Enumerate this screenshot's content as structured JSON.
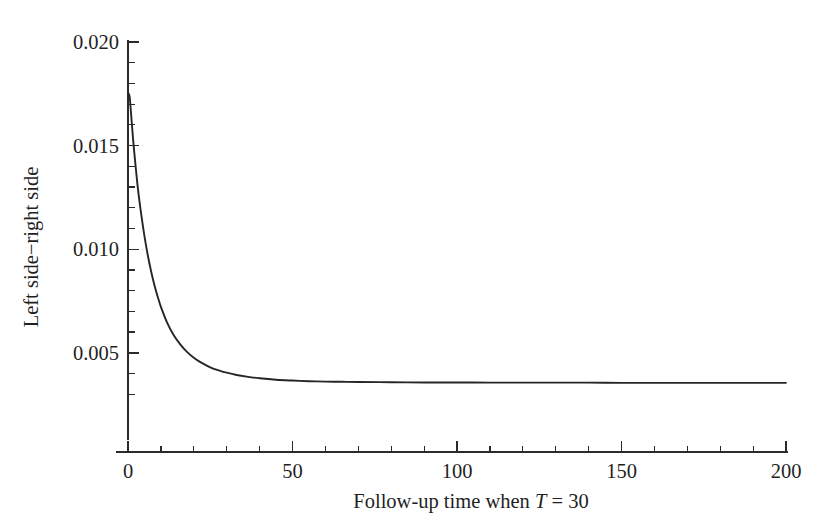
{
  "chart_data": {
    "type": "line",
    "title": "",
    "xlabel": "Follow-up time when T = 30",
    "xlabel_parts": {
      "prefix": "Follow-up time when ",
      "italic_symbol": "T",
      "suffix": " = 30"
    },
    "ylabel": "Left side−right side",
    "xlim": [
      0,
      200
    ],
    "ylim": [
      0.0025,
      0.0205
    ],
    "grid": false,
    "legend": null,
    "xticks": [
      0,
      50,
      100,
      150,
      200
    ],
    "xticklabels": [
      "0",
      "50",
      "100",
      "150",
      "200"
    ],
    "xtick_minor_step": 10,
    "yticks": [
      0.005,
      0.01,
      0.015,
      0.02
    ],
    "yticklabels": [
      "0.005",
      "0.010",
      "0.015",
      "0.020"
    ],
    "ytick_minor_step": 0.001,
    "series": [
      {
        "name": "Left side minus right side",
        "color": "#262626",
        "x": [
          0,
          0.5,
          1,
          1.5,
          2,
          3,
          4,
          5,
          6,
          7,
          8,
          9,
          10,
          12,
          14,
          16,
          18,
          20,
          22,
          25,
          28,
          30,
          33,
          36,
          40,
          45,
          50,
          55,
          60,
          65,
          70,
          80,
          90,
          100,
          110,
          120,
          130,
          140,
          150,
          160,
          170,
          180,
          190,
          200
        ],
        "y": [
          0.01755,
          0.01735,
          0.0164,
          0.0154,
          0.01452,
          0.01295,
          0.0117,
          0.01063,
          0.00972,
          0.00895,
          0.00828,
          0.00772,
          0.00722,
          0.00642,
          0.00582,
          0.00538,
          0.00503,
          0.00476,
          0.00455,
          0.0043,
          0.00413,
          0.00404,
          0.00393,
          0.00385,
          0.00377,
          0.0037,
          0.00366,
          0.00363,
          0.00361,
          0.0036,
          0.00359,
          0.00358,
          0.00357,
          0.00357,
          0.00356,
          0.00356,
          0.00356,
          0.00356,
          0.00355,
          0.00355,
          0.00355,
          0.00355,
          0.00355,
          0.00355
        ]
      }
    ]
  }
}
